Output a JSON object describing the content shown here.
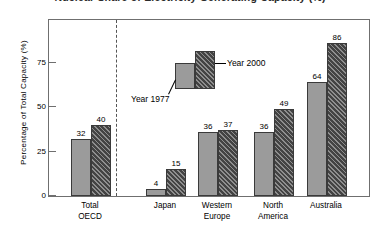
{
  "figure": {
    "title": "Nuclear Share of Electricity Generating Capacity (%)",
    "ylabel": "Percentage of Total Capacity (%)"
  },
  "legend": {
    "item_1977": "Year 1977",
    "item_2000": "Year 2000"
  },
  "axis": {
    "yticks": [
      "0",
      "25",
      "50",
      "75"
    ]
  },
  "chart_data": {
    "type": "bar",
    "title": "Nuclear Share of Electricity Generating Capacity (%)",
    "xlabel": "",
    "ylabel": "Percentage of Total Capacity (%)",
    "ylim": [
      0,
      100
    ],
    "ytick_values": [
      0,
      25,
      50,
      75
    ],
    "grid": false,
    "legend_position": "inside-upper-center",
    "categories": [
      "Total\nOECD",
      "Japan",
      "Western\nEurope",
      "North\nAmerica",
      "Australia"
    ],
    "series": [
      {
        "name": "Year 1977",
        "color": "#9b9b9b",
        "values": [
          32,
          4,
          36,
          36,
          64
        ]
      },
      {
        "name": "Year 2000",
        "color": "#434343",
        "values": [
          40,
          15,
          37,
          49,
          86
        ]
      }
    ],
    "annotations": [
      "Dashed vertical separator between 'Total OECD' and the individual regions"
    ]
  },
  "bars": [
    {
      "cat": "Total\nOECD",
      "v1977": "32",
      "v2000": "40",
      "n1977": 32,
      "n2000": 40
    },
    {
      "cat": "Japan",
      "v1977": "4",
      "v2000": "15",
      "n1977": 4,
      "n2000": 15
    },
    {
      "cat": "Western\nEurope",
      "v1977": "36",
      "v2000": "37",
      "n1977": 36,
      "n2000": 37
    },
    {
      "cat": "North\nAmerica",
      "v1977": "36",
      "v2000": "49",
      "n1977": 36,
      "n2000": 49
    },
    {
      "cat": "Australia",
      "v1977": "64",
      "v2000": "86",
      "n1977": 64,
      "n2000": 86
    }
  ],
  "colors": {
    "series_1977": "#9b9b9b",
    "series_2000": "#434343",
    "frame": "#6f6f6f",
    "divider": "#555555"
  }
}
